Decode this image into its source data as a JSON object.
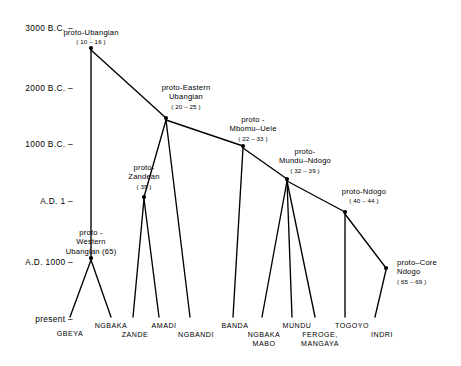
{
  "figure": {
    "type": "linguistic-family-tree",
    "axis": {
      "label_ticks": [
        {
          "text": "3000 B.C. –",
          "y": 28
        },
        {
          "text": "2000 B.C. –",
          "y": 88
        },
        {
          "text": "1000 B.C. –",
          "y": 144
        },
        {
          "text": "A.D. 1 –",
          "y": 201
        },
        {
          "text": "A.D. 1000 –",
          "y": 262
        },
        {
          "text": "present –",
          "y": 319
        }
      ]
    },
    "nodes": [
      {
        "id": "ubangian",
        "name": "proto-Ubangian",
        "count": "( 10 – 16 )",
        "x": 91,
        "y": 48,
        "lx": 91,
        "ly": 28,
        "align": "center"
      },
      {
        "id": "eastern",
        "name": "proto-Eastern\nUbangian",
        "count": "( 20 – 25 )",
        "x": 166,
        "y": 118,
        "lx": 186,
        "ly": 83,
        "align": "center"
      },
      {
        "id": "zandean",
        "name": "proto-\nZandean",
        "count": "( 39 )",
        "x": 144,
        "y": 197,
        "lx": 144,
        "ly": 163,
        "align": "center"
      },
      {
        "id": "mbomu",
        "name": "proto -\nMbomu–Uele",
        "count": "( 22 – 33 )",
        "x": 243,
        "y": 146,
        "lx": 253,
        "ly": 115,
        "align": "center"
      },
      {
        "id": "mundundogo",
        "name": "proto-\nMundu–Ndogo",
        "count": "( 32 – 39 )",
        "x": 287,
        "y": 179,
        "lx": 305,
        "ly": 147,
        "align": "center"
      },
      {
        "id": "ndogo",
        "name": "proto-Ndogo",
        "count": "( 40 – 44 )",
        "x": 345,
        "y": 212,
        "lx": 364,
        "ly": 187,
        "align": "center"
      },
      {
        "id": "western",
        "name": "proto -\nWestern\nUbangian (65)",
        "count": "",
        "x": 91,
        "y": 258,
        "lx": 91,
        "ly": 228,
        "align": "center"
      },
      {
        "id": "corendogo",
        "name": "proto–Core\nNdogo",
        "count": "( 65 – 69 )",
        "x": 386,
        "y": 268,
        "lx": 397,
        "ly": 258,
        "align": "left"
      }
    ],
    "leaves": [
      {
        "label": "GBEYA",
        "x": 70,
        "y": 330,
        "tipx": 70,
        "tipy": 320
      },
      {
        "label": "NGBAKA",
        "x": 111,
        "y": 322,
        "tipx": 111,
        "tipy": 317
      },
      {
        "label": "ZANDE",
        "x": 135,
        "y": 331,
        "tipx": 133,
        "tipy": 320
      },
      {
        "label": "AMADI",
        "x": 164,
        "y": 322,
        "tipx": 159,
        "tipy": 317
      },
      {
        "label": "NGBANDI",
        "x": 196,
        "y": 331,
        "tipx": 190,
        "tipy": 320
      },
      {
        "label": "BANDA",
        "x": 235,
        "y": 322,
        "tipx": 233,
        "tipy": 317
      },
      {
        "label": "NGBAKA\nMABO",
        "x": 264,
        "y": 331,
        "tipx": 262,
        "tipy": 320
      },
      {
        "label": "MUNDU",
        "x": 297,
        "y": 322,
        "tipx": 292,
        "tipy": 317
      },
      {
        "label": "FEROGE,\nMANGAYA",
        "x": 320,
        "y": 331,
        "tipx": 315,
        "tipy": 320
      },
      {
        "label": "TOGOYO",
        "x": 352,
        "y": 322,
        "tipx": 345,
        "tipy": 317
      },
      {
        "label": "INDRI",
        "x": 382,
        "y": 331,
        "tipx": 375,
        "tipy": 320
      }
    ],
    "edges": [
      {
        "from": "ubangian",
        "to": "eastern",
        "x1": 91,
        "y1": 50,
        "x2": 166,
        "y2": 118
      },
      {
        "from": "ubangian",
        "to": "western",
        "x1": 91,
        "y1": 50,
        "x2": 91,
        "y2": 258
      },
      {
        "from": "eastern",
        "to": "zandean",
        "x1": 166,
        "y1": 120,
        "x2": 144,
        "y2": 197
      },
      {
        "from": "eastern",
        "to": "mbomu",
        "x1": 166,
        "y1": 120,
        "x2": 243,
        "y2": 146
      },
      {
        "from": "eastern",
        "to": "ngbandi",
        "x1": 166,
        "y1": 120,
        "x2": 190,
        "y2": 317
      },
      {
        "from": "zandean",
        "to": "zande",
        "x1": 144,
        "y1": 199,
        "x2": 133,
        "y2": 317
      },
      {
        "from": "zandean",
        "to": "amadi",
        "x1": 144,
        "y1": 199,
        "x2": 159,
        "y2": 317
      },
      {
        "from": "mbomu",
        "to": "banda",
        "x1": 243,
        "y1": 148,
        "x2": 233,
        "y2": 317
      },
      {
        "from": "mbomu",
        "to": "mundundogo",
        "x1": 243,
        "y1": 148,
        "x2": 287,
        "y2": 179
      },
      {
        "from": "mundundogo",
        "to": "ngbakamabo",
        "x1": 287,
        "y1": 181,
        "x2": 262,
        "y2": 317
      },
      {
        "from": "mundundogo",
        "to": "mundu",
        "x1": 287,
        "y1": 181,
        "x2": 292,
        "y2": 317
      },
      {
        "from": "mundundogo",
        "to": "feroge",
        "x1": 287,
        "y1": 181,
        "x2": 315,
        "y2": 317
      },
      {
        "from": "mundundogo",
        "to": "ndogo",
        "x1": 287,
        "y1": 181,
        "x2": 345,
        "y2": 212
      },
      {
        "from": "ndogo",
        "to": "togoyo",
        "x1": 345,
        "y1": 214,
        "x2": 345,
        "y2": 317
      },
      {
        "from": "ndogo",
        "to": "corendogo",
        "x1": 345,
        "y1": 214,
        "x2": 386,
        "y2": 268
      },
      {
        "from": "corendogo",
        "to": "indri",
        "x1": 386,
        "y1": 270,
        "x2": 375,
        "y2": 317
      },
      {
        "from": "western",
        "to": "gbeya",
        "x1": 91,
        "y1": 260,
        "x2": 70,
        "y2": 317
      },
      {
        "from": "western",
        "to": "ngbaka",
        "x1": 91,
        "y1": 260,
        "x2": 111,
        "y2": 317
      }
    ],
    "style": {
      "line_color": "#000000",
      "node_color": "#000000",
      "background": "#ffffff"
    }
  }
}
